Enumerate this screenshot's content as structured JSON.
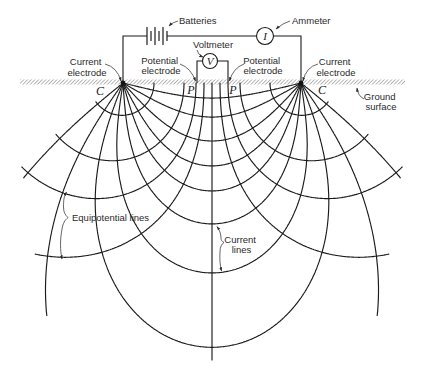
{
  "labels": {
    "batteries": "Batteries",
    "ammeter": "Ammeter",
    "ammeter_symbol": "I",
    "voltmeter": "Voltmeter",
    "voltmeter_symbol": "V",
    "current_electrode_left": [
      "Current",
      "electrode"
    ],
    "potential_electrode_left": [
      "Potential",
      "electrode"
    ],
    "potential_electrode_right": [
      "Potential",
      "electrode"
    ],
    "current_electrode_right": [
      "Current",
      "electrode"
    ],
    "ground_surface": [
      "Ground",
      "surface"
    ],
    "equipotential_lines": "Equipotential lines",
    "current_lines": [
      "Current",
      "lines"
    ],
    "electrode_c_left": "C",
    "electrode_p_left": "P",
    "electrode_p_right": "P",
    "electrode_c_right": "C"
  },
  "diagram": {
    "ground_y": 83,
    "electrode_left": [
      123,
      83
    ],
    "electrode_right": [
      301,
      83
    ],
    "midline_bottom_y": 360,
    "current_lines": [
      {
        "angle": 13.6
      },
      {
        "angle": 29.8
      },
      {
        "angle": 47.5
      },
      {
        "angle": 62.4
      },
      {
        "angle": 74.2
      },
      {
        "angle": 86.1
      },
      {
        "angle": 98.7
      },
      {
        "angle": 111.2
      },
      {
        "angle": 125,
        "max_y": 316
      },
      {
        "angle": 141,
        "max_y": 178
      }
    ],
    "equipotentials": [
      {
        "ground_x": 154,
        "end_angle": 145
      },
      {
        "ground_x": 184,
        "end_angle": 142
      },
      {
        "ground_x": 196,
        "end_angle": 140
      },
      {
        "ground_x": 204,
        "end_angle": 117
      }
    ]
  }
}
